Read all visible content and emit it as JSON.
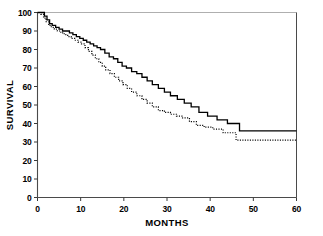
{
  "chart_data": {
    "type": "line",
    "title": "",
    "subtitle": "",
    "xlabel": "MONTHS",
    "ylabel": "SURVIVAL",
    "xlim": [
      0,
      60
    ],
    "ylim": [
      0,
      100
    ],
    "xticks": [
      0,
      10,
      20,
      30,
      40,
      50,
      60
    ],
    "yticks": [
      0,
      10,
      20,
      30,
      40,
      50,
      60,
      70,
      80,
      90,
      100
    ],
    "xtick_labels": [
      "0",
      "10",
      "20",
      "30",
      "40",
      "50",
      "60"
    ],
    "ytick_labels": [
      "0",
      "10",
      "20",
      "30",
      "40",
      "50",
      "60",
      "70",
      "80",
      "90",
      "100"
    ],
    "grid": false,
    "legend": "none",
    "frame": "box-open-right-bottom",
    "series": [
      {
        "name": "solid-curve",
        "style": "solid",
        "color": "#000000",
        "linewidth": 1.3,
        "step": "post",
        "x": [
          0,
          1.0,
          1.6,
          2.2,
          2.8,
          3.4,
          4.2,
          5.0,
          5.8,
          6.6,
          7.4,
          8.2,
          9.0,
          9.8,
          10.6,
          11.4,
          12.2,
          13.0,
          13.8,
          14.6,
          15.6,
          16.6,
          17.6,
          18.6,
          19.6,
          20.6,
          21.8,
          23.0,
          24.2,
          25.4,
          26.6,
          28.0,
          29.4,
          30.8,
          32.4,
          34.0,
          35.6,
          37.4,
          39.4,
          41.6,
          44.0,
          46.8,
          60
        ],
        "y": [
          100,
          100,
          98,
          96,
          94,
          93,
          92,
          91,
          90,
          90,
          89,
          88,
          87,
          86,
          85,
          84,
          83,
          82,
          81,
          80,
          78,
          76,
          75,
          73,
          71,
          70,
          68,
          67,
          65,
          63,
          61,
          59,
          57,
          55,
          53,
          51,
          49,
          46,
          44,
          42,
          40,
          36,
          36
        ]
      },
      {
        "name": "dotted-curve",
        "style": "dotted",
        "color": "#000000",
        "linewidth": 1.2,
        "step": "post",
        "x": [
          0,
          0.8,
          1.4,
          2.0,
          2.6,
          3.2,
          3.9,
          4.6,
          5.4,
          6.2,
          7.0,
          7.8,
          8.6,
          9.4,
          10.2,
          11.0,
          11.8,
          12.6,
          13.4,
          14.2,
          15.0,
          15.8,
          16.8,
          17.8,
          18.8,
          19.8,
          20.8,
          21.8,
          23.0,
          24.2,
          25.4,
          26.6,
          28.0,
          29.4,
          30.8,
          32.2,
          33.6,
          35.2,
          36.8,
          38.6,
          40.6,
          43.0,
          46.0,
          60
        ],
        "y": [
          100,
          99,
          97,
          95,
          93,
          92,
          91,
          90,
          89,
          88,
          87,
          86,
          85,
          84,
          83,
          81,
          79,
          77,
          75,
          73,
          71,
          69,
          67,
          65,
          63,
          61,
          59,
          57,
          55,
          53,
          51,
          49,
          47,
          46,
          45,
          44,
          43,
          41,
          39,
          38,
          37,
          35,
          31,
          31
        ]
      }
    ]
  },
  "axes": {
    "y_title": "SURVIVAL",
    "x_title": "MONTHS"
  }
}
